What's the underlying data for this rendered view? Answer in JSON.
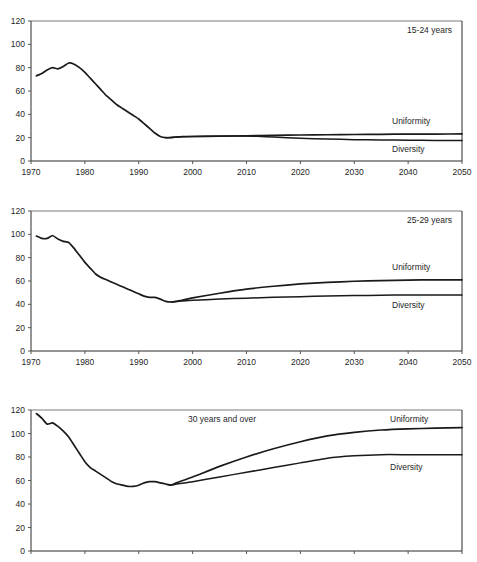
{
  "figure": {
    "name": "three-panel-line-chart",
    "background": "#ffffff",
    "line_color": "#1a1a1a",
    "axis_color": "#2b2b2b"
  },
  "chart_data": [
    {
      "type": "line",
      "title": "15-24 years",
      "xlabel": "",
      "ylabel": "",
      "xlim": [
        1970,
        2050
      ],
      "ylim": [
        0,
        120
      ],
      "yticks": [
        0,
        20,
        40,
        60,
        80,
        100,
        120
      ],
      "xticks": [
        1970,
        1980,
        1990,
        2000,
        2010,
        2020,
        2030,
        2040,
        2050
      ],
      "grid": false,
      "legend_position": "inline-right",
      "series": [
        {
          "name": "Uniformity",
          "x": [
            1971,
            1972,
            1973,
            1974,
            1975,
            1976,
            1977,
            1978,
            1979,
            1980,
            1981,
            1982,
            1983,
            1984,
            1985,
            1986,
            1987,
            1988,
            1989,
            1990,
            1991,
            1992,
            1993,
            1994,
            1995,
            1996,
            1997,
            1998,
            2000,
            2005,
            2010,
            2015,
            2020,
            2025,
            2030,
            2035,
            2040,
            2045,
            2050
          ],
          "values": [
            73,
            75,
            78,
            80,
            79,
            81,
            84,
            83,
            80,
            76,
            71,
            66,
            61,
            56,
            52,
            48,
            45,
            42,
            39,
            36,
            32,
            28,
            24,
            21,
            20,
            20,
            20.5,
            21,
            21,
            21.3,
            21.6,
            22,
            22.3,
            22.5,
            22.7,
            22.9,
            23,
            23.1,
            23.2
          ]
        },
        {
          "name": "Diversity",
          "x": [
            1995,
            2000,
            2005,
            2010,
            2012,
            2015,
            2020,
            2025,
            2030,
            2035,
            2040,
            2045,
            2050
          ],
          "values": [
            20,
            21,
            21.3,
            21.5,
            21.2,
            20.5,
            19.5,
            18.8,
            18.3,
            18,
            17.8,
            17.6,
            17.5
          ]
        }
      ]
    },
    {
      "type": "line",
      "title": "25-29 years",
      "xlabel": "",
      "ylabel": "",
      "xlim": [
        1970,
        2050
      ],
      "ylim": [
        0,
        120
      ],
      "yticks": [
        0,
        20,
        40,
        60,
        80,
        100,
        120
      ],
      "xticks": [
        1970,
        1980,
        1990,
        2000,
        2010,
        2020,
        2030,
        2040,
        2050
      ],
      "grid": false,
      "legend_position": "inline-right",
      "series": [
        {
          "name": "Uniformity",
          "x": [
            1971,
            1972,
            1973,
            1974,
            1975,
            1976,
            1977,
            1978,
            1979,
            1980,
            1981,
            1982,
            1983,
            1984,
            1985,
            1986,
            1987,
            1988,
            1989,
            1990,
            1991,
            1992,
            1993,
            1994,
            1995,
            1996,
            1997,
            1998,
            2000,
            2005,
            2010,
            2015,
            2020,
            2025,
            2030,
            2035,
            2040,
            2045,
            2050
          ],
          "values": [
            98.5,
            96.5,
            96.5,
            99,
            96,
            94,
            93,
            88,
            82,
            76,
            71,
            66,
            63,
            61,
            59,
            57,
            55,
            53,
            51,
            49,
            47,
            46,
            46,
            44.5,
            42.5,
            42,
            42.5,
            43.5,
            45.5,
            49.5,
            53,
            55.5,
            57.5,
            58.8,
            59.8,
            60.4,
            60.8,
            61,
            61
          ]
        },
        {
          "name": "Diversity",
          "x": [
            1996,
            1998,
            2000,
            2005,
            2010,
            2015,
            2020,
            2025,
            2030,
            2035,
            2040,
            2045,
            2050
          ],
          "values": [
            42,
            42.8,
            43.5,
            44.5,
            45.3,
            46,
            46.6,
            47.1,
            47.5,
            47.8,
            48,
            48,
            48
          ]
        }
      ]
    },
    {
      "type": "line",
      "title": "30 years and over",
      "xlabel": "",
      "ylabel": "",
      "xlim": [
        1970,
        2050
      ],
      "ylim": [
        0,
        120
      ],
      "yticks": [
        0,
        20,
        40,
        60,
        80,
        100,
        120
      ],
      "xticks": [
        1970,
        1980,
        1990,
        2000,
        2010,
        2020,
        2030,
        2040,
        2050
      ],
      "grid": false,
      "legend_position": "inline-right",
      "series": [
        {
          "name": "Uniformity",
          "x": [
            1971,
            1972,
            1973,
            1974,
            1975,
            1976,
            1977,
            1978,
            1979,
            1980,
            1981,
            1982,
            1983,
            1984,
            1985,
            1986,
            1987,
            1988,
            1989,
            1990,
            1991,
            1992,
            1993,
            1994,
            1995,
            1996,
            1997,
            2000,
            2005,
            2010,
            2015,
            2020,
            2025,
            2030,
            2035,
            2040,
            2045,
            2050
          ],
          "values": [
            117,
            113,
            108,
            109,
            106,
            102,
            97,
            90,
            83,
            76,
            71,
            68,
            65,
            62,
            59,
            57,
            56,
            55,
            55,
            56,
            58,
            59,
            59,
            58,
            57,
            56,
            58,
            63,
            72,
            80,
            87,
            93,
            98,
            101,
            103,
            104,
            104.5,
            105
          ]
        },
        {
          "name": "Diversity",
          "x": [
            1996,
            1997,
            2000,
            2005,
            2010,
            2015,
            2020,
            2025,
            2030,
            2035,
            2040,
            2045,
            2050
          ],
          "values": [
            56,
            57,
            59,
            63,
            67,
            71,
            75,
            79,
            81,
            82,
            82,
            82,
            82
          ]
        }
      ]
    }
  ]
}
